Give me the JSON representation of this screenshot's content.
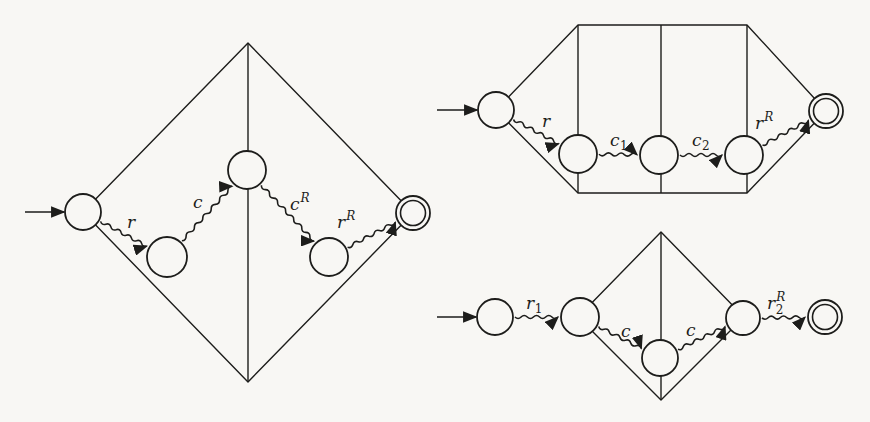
{
  "figure": {
    "background_color": "#f8f7f4",
    "ink_color": "#1d1d1b",
    "diagrams": [
      {
        "id": "left-diamond-automaton",
        "outline": {
          "points": [
            [
              248,
              43
            ],
            [
              413,
              213
            ],
            [
              248,
              382
            ],
            [
              83,
              212
            ]
          ]
        },
        "inner_lines": [
          [
            [
              248,
              43
            ],
            [
              248,
              382
            ]
          ]
        ],
        "nodes": [
          {
            "id": "q0",
            "x": 83,
            "y": 212,
            "r": 18,
            "kind": "start"
          },
          {
            "id": "q1",
            "x": 167,
            "y": 257,
            "r": 20,
            "kind": "state"
          },
          {
            "id": "q2",
            "x": 247,
            "y": 170,
            "r": 19,
            "kind": "state"
          },
          {
            "id": "q3",
            "x": 329,
            "y": 257,
            "r": 19,
            "kind": "state"
          },
          {
            "id": "q4",
            "x": 413,
            "y": 213,
            "r": 17,
            "kind": "accept"
          }
        ],
        "start_arrow": [
          [
            25,
            212
          ],
          [
            64,
            212
          ]
        ],
        "transitions": [
          {
            "from": "q0",
            "to": "q1",
            "label": {
              "main": "r"
            },
            "label_pos": [
              127,
              228
            ]
          },
          {
            "from": "q1",
            "to": "q2",
            "label": {
              "main": "c"
            },
            "label_pos": [
              193,
              208
            ]
          },
          {
            "from": "q2",
            "to": "q3",
            "label": {
              "main": "c",
              "sup": "R"
            },
            "label_pos": [
              290,
              210
            ]
          },
          {
            "from": "q3",
            "to": "q4",
            "label": {
              "main": "r",
              "sup": "R"
            },
            "label_pos": [
              337,
              228
            ]
          }
        ]
      },
      {
        "id": "top-right-hexagon-automaton",
        "outline": {
          "points": [
            [
              496,
              110
            ],
            [
              578,
              25
            ],
            [
              747,
              25
            ],
            [
              826,
              111
            ],
            [
              747,
              193
            ],
            [
              578,
              193
            ]
          ]
        },
        "inner_lines": [
          [
            [
              578,
              25
            ],
            [
              578,
              193
            ]
          ],
          [
            [
              661,
              25
            ],
            [
              661,
              193
            ]
          ],
          [
            [
              747,
              25
            ],
            [
              747,
              193
            ]
          ]
        ],
        "nodes": [
          {
            "id": "p0",
            "x": 496,
            "y": 110,
            "r": 18,
            "kind": "start"
          },
          {
            "id": "p1",
            "x": 578,
            "y": 154,
            "r": 19,
            "kind": "state"
          },
          {
            "id": "p2",
            "x": 659,
            "y": 155,
            "r": 19,
            "kind": "state"
          },
          {
            "id": "p3",
            "x": 744,
            "y": 155,
            "r": 19,
            "kind": "state"
          },
          {
            "id": "p4",
            "x": 826,
            "y": 111,
            "r": 17,
            "kind": "accept"
          }
        ],
        "start_arrow": [
          [
            437,
            110
          ],
          [
            477,
            110
          ]
        ],
        "transitions": [
          {
            "from": "p0",
            "to": "p1",
            "label": {
              "main": "r"
            },
            "label_pos": [
              542,
              127
            ]
          },
          {
            "from": "p1",
            "to": "p2",
            "label": {
              "main": "c",
              "sub": "1"
            },
            "label_pos": [
              610,
              146
            ]
          },
          {
            "from": "p2",
            "to": "p3",
            "label": {
              "main": "c",
              "sub": "2"
            },
            "label_pos": [
              692,
              146
            ]
          },
          {
            "from": "p3",
            "to": "p4",
            "label": {
              "main": "r",
              "sup": "R"
            },
            "label_pos": [
              755,
              129
            ]
          }
        ]
      },
      {
        "id": "bottom-right-diamond-automaton",
        "outline": {
          "points": [
            [
              661,
              232
            ],
            [
              744,
              317
            ],
            [
              661,
              400
            ],
            [
              578,
              317
            ]
          ]
        },
        "inner_lines": [
          [
            [
              661,
              232
            ],
            [
              661,
              400
            ]
          ]
        ],
        "nodes": [
          {
            "id": "s0",
            "x": 495,
            "y": 317,
            "r": 18,
            "kind": "start"
          },
          {
            "id": "s1",
            "x": 580,
            "y": 317,
            "r": 19,
            "kind": "state"
          },
          {
            "id": "s2",
            "x": 660,
            "y": 358,
            "r": 18,
            "kind": "state"
          },
          {
            "id": "s3",
            "x": 743,
            "y": 318,
            "r": 17,
            "kind": "state"
          },
          {
            "id": "s4",
            "x": 825,
            "y": 317,
            "r": 17,
            "kind": "accept"
          }
        ],
        "start_arrow": [
          [
            437,
            317
          ],
          [
            476,
            317
          ]
        ],
        "transitions": [
          {
            "from": "s0",
            "to": "s1",
            "label": {
              "main": "r",
              "sub": "1"
            },
            "label_pos": [
              526,
              309
            ]
          },
          {
            "from": "s1",
            "to": "s2",
            "label": {
              "main": "c"
            },
            "label_pos": [
              621,
              337
            ]
          },
          {
            "from": "s2",
            "to": "s3",
            "label": {
              "main": "c"
            },
            "label_pos": [
              686,
              336
            ]
          },
          {
            "from": "s3",
            "to": "s4",
            "label": {
              "main": "r",
              "sub": "2",
              "sup": "R"
            },
            "label_pos": [
              767,
              309
            ]
          }
        ]
      }
    ]
  }
}
